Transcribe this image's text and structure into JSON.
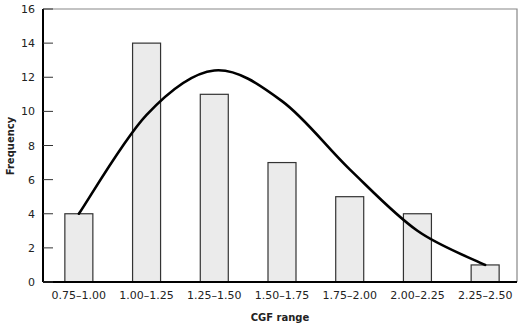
{
  "chart_data": {
    "type": "bar",
    "title": "",
    "xlabel": "CGF range",
    "ylabel": "Frequency",
    "categories": [
      "0.75–1.00",
      "1.00–1.25",
      "1.25–1.50",
      "1.50–1.75",
      "1.75–2.00",
      "2.00–2.25",
      "2.25–2.50"
    ],
    "values": [
      4,
      14,
      11,
      7,
      5,
      4,
      1
    ],
    "ylim": [
      0,
      16
    ],
    "yticks": [
      0,
      2,
      4,
      6,
      8,
      10,
      12,
      14,
      16
    ],
    "grid": false,
    "legend": null,
    "overlay_curve": {
      "type": "line",
      "description": "Smooth fitted distribution curve",
      "points": [
        {
          "x": "0.75–1.00",
          "y": 4.0
        },
        {
          "x": "1.00–1.25",
          "y": 9.8
        },
        {
          "x": "1.25–1.50",
          "y": 12.4
        },
        {
          "x": "1.50–1.75",
          "y": 10.6
        },
        {
          "x": "1.75–2.00",
          "y": 6.6
        },
        {
          "x": "2.00–2.25",
          "y": 3.0
        },
        {
          "x": "2.25–2.50",
          "y": 1.0
        }
      ],
      "peak": {
        "x_position": 1.35,
        "y": 12.6
      }
    },
    "colors": {
      "bar_fill": "#ebebeb",
      "bar_stroke": "#333333",
      "curve": "#000000",
      "axis": "#000000",
      "frame": "#888888"
    }
  }
}
